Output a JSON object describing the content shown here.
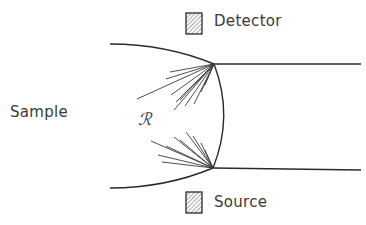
{
  "diagram": {
    "labels": {
      "detector": "Detector",
      "source": "Source",
      "sample": "Sample",
      "region": "ℛ"
    },
    "colors": {
      "stroke": "#2a2a2a",
      "text": "#3a3a3a",
      "hatch": "#555555"
    }
  }
}
